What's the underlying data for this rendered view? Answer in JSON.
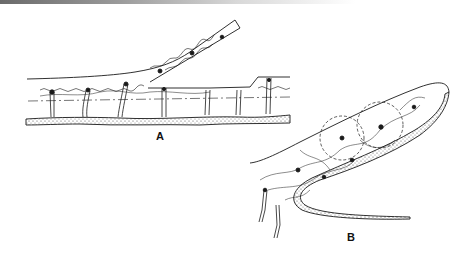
{
  "figure": {
    "panels": [
      {
        "id": "A",
        "label": "A"
      },
      {
        "id": "B",
        "label": "B"
      }
    ],
    "colors": {
      "ink": "#1a1a1a",
      "background": "#ffffff"
    }
  }
}
